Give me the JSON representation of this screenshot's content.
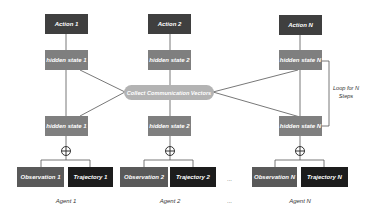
{
  "diagram": {
    "center_node": "Collect Communication Vectors",
    "loop_label": "Loop for N Steps",
    "ellipsis": "...",
    "colors": {
      "action": "#3f3f3f",
      "hidden_state": "#7f7f7f",
      "observation": "#595959",
      "trajectory": "#1c1c1c",
      "collector": "#b3b3b3",
      "line": "#555555"
    },
    "agents": [
      {
        "name": "Agent 1",
        "action": "Action 1",
        "hidden_top": "hidden state 1",
        "hidden_bottom": "hidden state 1",
        "observation": "Observation 1",
        "trajectory": "Trajectory 1"
      },
      {
        "name": "Agent 2",
        "action": "Action 2",
        "hidden_top": "hidden state 2",
        "hidden_bottom": "hidden state 2",
        "observation": "Observation 2",
        "trajectory": "Trajectory 2"
      },
      {
        "name": "Agent N",
        "action": "Action N",
        "hidden_top": "hidden state N",
        "hidden_bottom": "hidden state N",
        "observation": "Observation N",
        "trajectory": "Trajectory N"
      }
    ]
  }
}
